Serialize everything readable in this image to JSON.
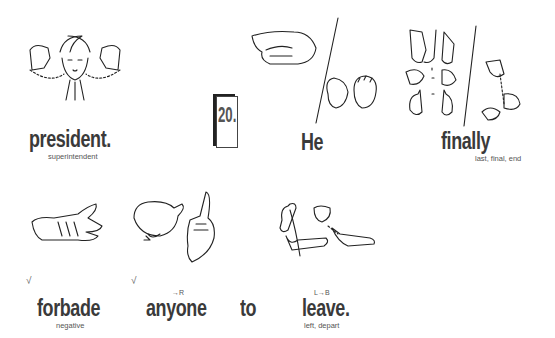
{
  "page": {
    "sentence_number": "20.",
    "signs": [
      {
        "word": "president.",
        "gloss": "superintendent",
        "check": "",
        "direction": ""
      },
      {
        "word": "He",
        "gloss": "",
        "check": "",
        "direction": ""
      },
      {
        "word": "finally",
        "gloss": "last, final, end",
        "check": "",
        "direction": ""
      },
      {
        "word": "forbade",
        "gloss": "negative",
        "check": "√",
        "direction": ""
      },
      {
        "word": "anyone",
        "gloss": "",
        "check": "√",
        "direction": "→R"
      },
      {
        "word": "to",
        "gloss": "",
        "check": "",
        "direction": ""
      },
      {
        "word": "leave.",
        "gloss": "left, depart",
        "check": "",
        "direction": "L→B"
      }
    ],
    "illustrations": [
      {
        "icon": "president-sign-illustration"
      },
      {
        "icon": "he-sign-illustration"
      },
      {
        "icon": "finally-sign-illustration"
      },
      {
        "icon": "forbade-sign-illustration"
      },
      {
        "icon": "anyone-sign-illustration"
      },
      {
        "icon": "leave-sign-illustration"
      }
    ]
  }
}
